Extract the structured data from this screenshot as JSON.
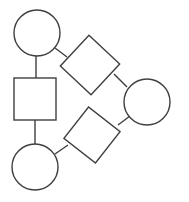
{
  "canvas": {
    "width": 189,
    "height": 202,
    "background_color": "#ffffff",
    "stroke_color": "#3f3f3f",
    "stroke_width": 1.4,
    "node_fill_color": "#ffffff"
  },
  "diagram": {
    "type": "node-link-graph",
    "node_count": 6,
    "edge_count": 6,
    "nodes": [
      {
        "id": "circle-top-left",
        "shape": "circle",
        "cx": 37,
        "cy": 33,
        "r": 23,
        "label": ""
      },
      {
        "id": "square-middle-left",
        "shape": "square",
        "cx": 35,
        "cy": 99,
        "size": 42,
        "rotation": 0,
        "label": ""
      },
      {
        "id": "circle-bottom-left",
        "shape": "circle",
        "cx": 35,
        "cy": 167,
        "r": 23,
        "label": ""
      },
      {
        "id": "diamond-upper",
        "shape": "square",
        "cx": 90,
        "cy": 65,
        "size": 42,
        "rotation": 43,
        "label": ""
      },
      {
        "id": "diamond-lower",
        "shape": "square",
        "cx": 92,
        "cy": 135,
        "size": 40,
        "rotation": 38,
        "label": ""
      },
      {
        "id": "circle-right",
        "shape": "circle",
        "cx": 147,
        "cy": 102,
        "r": 23,
        "label": ""
      }
    ],
    "edges": [
      {
        "id": "edge-circle-top-left--square-middle-left",
        "from": "circle-top-left",
        "to": "square-middle-left",
        "x1": 36,
        "y1": 56,
        "x2": 36,
        "y2": 79
      },
      {
        "id": "edge-square-middle-left--circle-bottom-left",
        "from": "square-middle-left",
        "to": "circle-bottom-left",
        "x1": 35,
        "y1": 120,
        "x2": 35,
        "y2": 145
      },
      {
        "id": "edge-circle-top-left--diamond-upper",
        "from": "circle-top-left",
        "to": "diamond-upper",
        "x1": 55,
        "y1": 48,
        "x2": 67,
        "y2": 57
      },
      {
        "id": "edge-diamond-upper--circle-right",
        "from": "diamond-upper",
        "to": "circle-right",
        "x1": 114,
        "y1": 74,
        "x2": 127,
        "y2": 87
      },
      {
        "id": "edge-diamond-lower--circle-right",
        "from": "diamond-lower",
        "to": "circle-right",
        "x1": 118,
        "y1": 125,
        "x2": 130,
        "y2": 116
      },
      {
        "id": "edge-circle-bottom-left--diamond-lower",
        "from": "circle-bottom-left",
        "to": "diamond-lower",
        "x1": 55,
        "y1": 154,
        "x2": 68,
        "y2": 145
      }
    ]
  }
}
